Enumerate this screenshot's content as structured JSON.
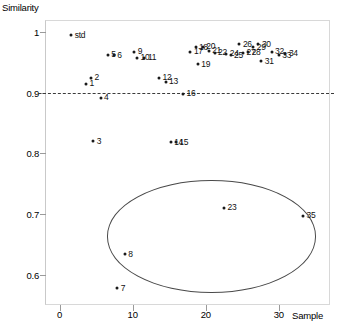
{
  "chart_data": {
    "type": "scatter",
    "title": "",
    "xlabel": "Sample",
    "ylabel": "Similarity",
    "xlim": [
      -2,
      37
    ],
    "ylim": [
      0.55,
      1.02
    ],
    "xticks": [
      0,
      10,
      20,
      30
    ],
    "xtick_labels": [
      "0",
      "10",
      "20",
      "30"
    ],
    "yticks": [
      0.6,
      0.7,
      0.8,
      0.9,
      1
    ],
    "ytick_labels": [
      "0.6",
      "0.7",
      "0.8",
      "0.9",
      "1"
    ],
    "grid": false,
    "legend": null,
    "annotations": [
      {
        "name": "threshold-line",
        "type": "hline",
        "y": 0.9,
        "style": "dashed",
        "color": "#3a3a3a"
      },
      {
        "name": "outlier-cluster-ellipse",
        "type": "ellipse",
        "center_x": 20.8,
        "center_y": 0.663,
        "width_x": 28.5,
        "height_y": 0.185,
        "color": "#4a4a4a"
      }
    ],
    "points": [
      {
        "label": "std",
        "x": 1.6,
        "y": 0.995
      },
      {
        "label": "1",
        "x": 3.6,
        "y": 0.915
      },
      {
        "label": "2",
        "x": 4.3,
        "y": 0.925
      },
      {
        "label": "3",
        "x": 4.6,
        "y": 0.82
      },
      {
        "label": "4",
        "x": 5.6,
        "y": 0.892
      },
      {
        "label": "5",
        "x": 6.6,
        "y": 0.963
      },
      {
        "label": "6",
        "x": 7.4,
        "y": 0.962
      },
      {
        "label": "7",
        "x": 7.9,
        "y": 0.578
      },
      {
        "label": "8",
        "x": 8.9,
        "y": 0.634
      },
      {
        "label": "9",
        "x": 10.2,
        "y": 0.968
      },
      {
        "label": "10",
        "x": 10.6,
        "y": 0.958
      },
      {
        "label": "11",
        "x": 11.6,
        "y": 0.958
      },
      {
        "label": "12",
        "x": 13.6,
        "y": 0.925
      },
      {
        "label": "13",
        "x": 14.5,
        "y": 0.918
      },
      {
        "label": "14",
        "x": 15.2,
        "y": 0.818
      },
      {
        "label": "15",
        "x": 15.9,
        "y": 0.818
      },
      {
        "label": "16",
        "x": 16.9,
        "y": 0.898
      },
      {
        "label": "17",
        "x": 17.9,
        "y": 0.968
      },
      {
        "label": "18",
        "x": 18.6,
        "y": 0.975
      },
      {
        "label": "19",
        "x": 18.9,
        "y": 0.947
      },
      {
        "label": "20",
        "x": 19.6,
        "y": 0.976
      },
      {
        "label": "21",
        "x": 20.4,
        "y": 0.969
      },
      {
        "label": "22",
        "x": 21.2,
        "y": 0.966
      },
      {
        "label": "23",
        "x": 22.5,
        "y": 0.71
      },
      {
        "label": "24",
        "x": 22.8,
        "y": 0.964
      },
      {
        "label": "25",
        "x": 23.4,
        "y": 0.962
      },
      {
        "label": "26",
        "x": 24.6,
        "y": 0.98
      },
      {
        "label": "27",
        "x": 25.1,
        "y": 0.966
      },
      {
        "label": "28",
        "x": 25.8,
        "y": 0.967
      },
      {
        "label": "29",
        "x": 26.5,
        "y": 0.975
      },
      {
        "label": "30",
        "x": 27.2,
        "y": 0.98
      },
      {
        "label": "31",
        "x": 27.6,
        "y": 0.952
      },
      {
        "label": "32",
        "x": 29.0,
        "y": 0.968
      },
      {
        "label": "33",
        "x": 30.0,
        "y": 0.962
      },
      {
        "label": "34",
        "x": 30.9,
        "y": 0.964
      },
      {
        "label": "35",
        "x": 33.3,
        "y": 0.697
      }
    ]
  }
}
